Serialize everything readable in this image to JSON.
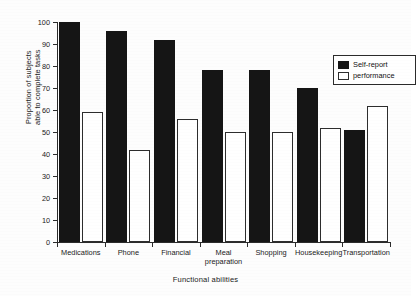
{
  "chart_data": {
    "type": "bar",
    "title": "",
    "xlabel": "Functional abilities",
    "ylabel_line1": "Proportion of subjects",
    "ylabel_line2": "able to complete tasks",
    "categories": [
      "Medications",
      "Phone",
      "Financial",
      "Meal preparation",
      "Shopping",
      "Housekeeping",
      "Transportation"
    ],
    "category_lines": [
      [
        "Medications"
      ],
      [
        "Phone"
      ],
      [
        "Financial"
      ],
      [
        "Meal",
        "preparation"
      ],
      [
        "Shopping"
      ],
      [
        "Housekeeping"
      ],
      [
        "Transportation"
      ]
    ],
    "series": [
      {
        "name": "Self-report",
        "color": "#151515",
        "fill": "solid",
        "values": [
          100,
          96,
          92,
          78,
          78,
          70,
          51
        ]
      },
      {
        "name": "performance",
        "color": "#ffffff",
        "fill": "outline",
        "values": [
          59,
          42,
          56,
          50,
          50,
          52,
          62
        ]
      }
    ],
    "ylim": [
      0,
      100
    ],
    "ytick_step": 10,
    "yticks": [
      0,
      10,
      20,
      30,
      40,
      50,
      60,
      70,
      80,
      90,
      100
    ],
    "ytick_labels": [
      "0",
      "10",
      "20",
      "30",
      "40",
      "50",
      "60",
      "70",
      "80",
      "90",
      "100"
    ],
    "grid": false,
    "legend_position": "upper-right-inside",
    "axis_style": "left-and-bottom-only"
  },
  "legend": {
    "entries": [
      {
        "label": "Self-report"
      },
      {
        "label": "performance"
      }
    ]
  }
}
